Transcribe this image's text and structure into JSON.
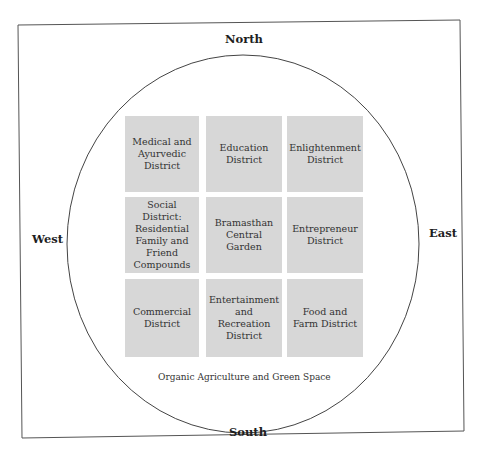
{
  "directions": {
    "north": "North",
    "south": "South",
    "west": "West",
    "east": "East"
  },
  "districts": [
    {
      "label": "Medical and Ayurvedic District",
      "lines": [
        "Medical and",
        "Ayurvedic",
        "District"
      ]
    },
    {
      "label": "Education District",
      "lines": [
        "Education",
        "District"
      ]
    },
    {
      "label": "Enlightenment District",
      "lines": [
        "Enlightenment",
        "District"
      ]
    },
    {
      "label": "Social District: Residential Family and Friend Compounds",
      "lines": [
        "Social District:",
        "Residential",
        "Family and",
        "Friend",
        "Compounds"
      ]
    },
    {
      "label": "Bramasthan Central Garden",
      "lines": [
        "Bramasthan",
        "Central Garden"
      ]
    },
    {
      "label": "Entrepreneur District",
      "lines": [
        "Entrepreneur",
        "District"
      ]
    },
    {
      "label": "Commercial District",
      "lines": [
        "Commercial",
        "District"
      ]
    },
    {
      "label": "Entertainment and Recreation District",
      "lines": [
        "Entertainment",
        "and Recreation",
        "District"
      ]
    },
    {
      "label": "Food and Farm District",
      "lines": [
        "Food and",
        "Farm District"
      ]
    }
  ],
  "surrounding_area": "Organic Agriculture and Green Space",
  "colors": {
    "district_fill": "#d7d7d7",
    "outline": "#555555"
  }
}
